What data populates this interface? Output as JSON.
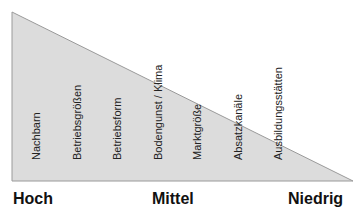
{
  "diagram": {
    "fill_color": "#dcdcdc",
    "edge_color": "#8a8a8a",
    "factors": [
      {
        "label": "Nachbarn",
        "x": 30
      },
      {
        "label": "Betriebsgrößen",
        "x": 71
      },
      {
        "label": "Betriebsform",
        "x": 111
      },
      {
        "label": "Bodengunst / Klima",
        "x": 152
      },
      {
        "label": "Marktgröße",
        "x": 191
      },
      {
        "label": "Absatzkanäle",
        "x": 232
      },
      {
        "label": "Ausbildungsstätten",
        "x": 272
      }
    ],
    "scale": {
      "high": "Hoch",
      "mid": "Mittel",
      "low": "Niedrig"
    }
  }
}
